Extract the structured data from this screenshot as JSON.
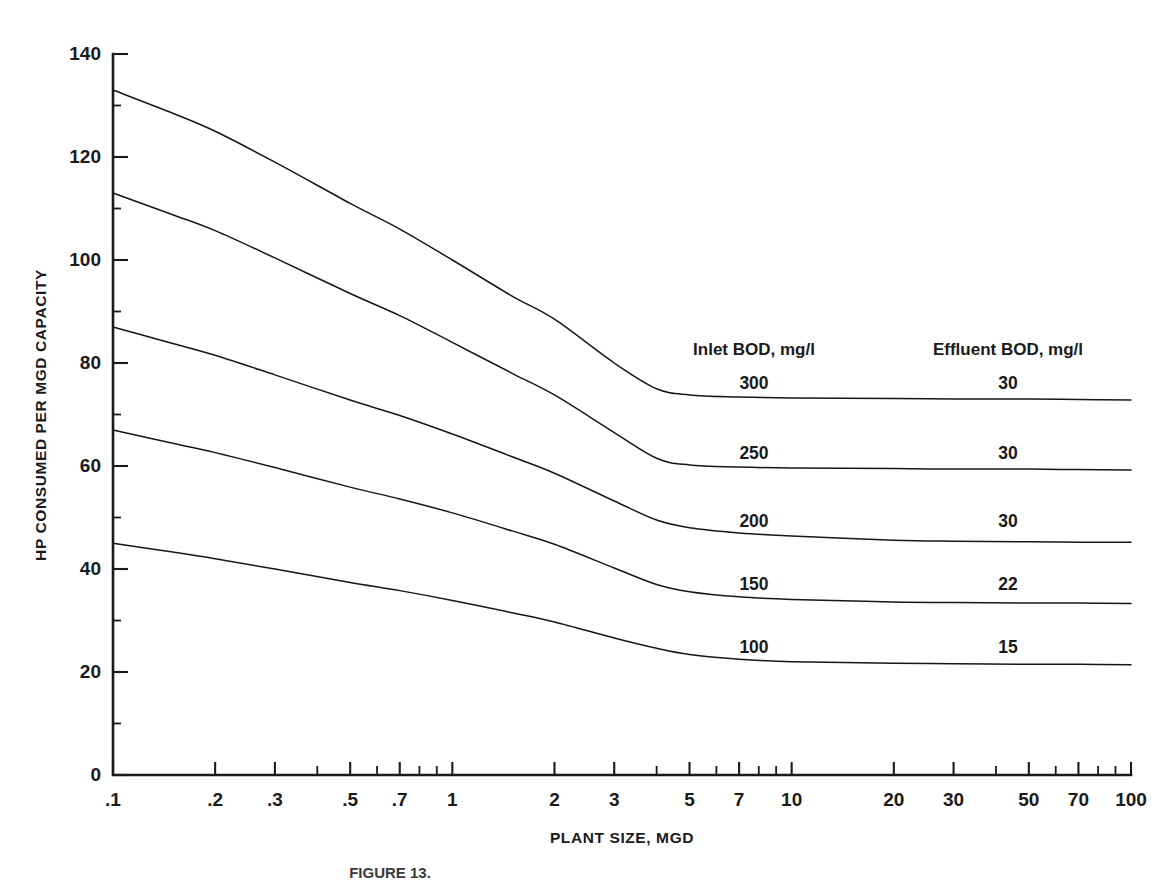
{
  "figure": {
    "caption": "FIGURE 13.",
    "background_color": "#ffffff",
    "line_color": "#161616"
  },
  "chart_data": {
    "type": "line",
    "title": "",
    "xlabel": "PLANT SIZE, MGD",
    "ylabel": "HP CONSUMED PER MGD CAPACITY",
    "xscale": "log",
    "xlim": [
      0.1,
      100
    ],
    "ylim": [
      0,
      140
    ],
    "grid": false,
    "legend_position": "inside-right",
    "xtick_labels": [
      ".1",
      ".2",
      ".3",
      ".5",
      ".7",
      "1",
      "2",
      "3",
      "5",
      "7",
      "10",
      "20",
      "30",
      "50",
      "70",
      "100"
    ],
    "xtick_values": [
      0.1,
      0.2,
      0.3,
      0.5,
      0.7,
      1,
      2,
      3,
      5,
      7,
      10,
      20,
      30,
      50,
      70,
      100
    ],
    "xtick_minor_values": [
      0.4,
      0.6,
      0.8,
      0.9,
      4,
      6,
      8,
      9,
      40,
      60,
      80,
      90
    ],
    "ytick_labels": [
      "0",
      "20",
      "40",
      "60",
      "80",
      "100",
      "120",
      "140"
    ],
    "ytick_values": [
      0,
      20,
      40,
      60,
      80,
      100,
      120,
      140
    ],
    "ytick_minor_values": [
      10,
      30,
      50,
      70,
      90,
      110,
      130
    ],
    "legend_headers": {
      "inlet": "Inlet BOD, mg/l",
      "effluent": "Effluent BOD, mg/l"
    },
    "x": [
      0.1,
      0.15,
      0.2,
      0.3,
      0.5,
      0.7,
      1,
      1.5,
      2,
      3,
      4,
      5,
      7,
      10,
      20,
      30,
      50,
      70,
      100
    ],
    "series": [
      {
        "name": "300",
        "inlet_bod": "300",
        "effluent_bod": "30",
        "values": [
          133,
          128.5,
          125,
          119,
          111,
          106,
          100,
          93,
          88.5,
          80,
          75,
          73.8,
          73.4,
          73.2,
          73.1,
          73.0,
          73.0,
          72.9,
          72.8
        ]
      },
      {
        "name": "250",
        "inlet_bod": "250",
        "effluent_bod": "30",
        "values": [
          113,
          108.8,
          105.7,
          100.4,
          93.5,
          89.2,
          84,
          78,
          73.8,
          66.5,
          61.5,
          60.2,
          59.8,
          59.6,
          59.5,
          59.4,
          59.4,
          59.3,
          59.2
        ]
      },
      {
        "name": "200",
        "inlet_bod": "200",
        "effluent_bod": "30",
        "values": [
          87,
          83.8,
          81.5,
          77.7,
          72.8,
          69.8,
          66.2,
          61.8,
          58.6,
          53.2,
          49.5,
          48.0,
          47.0,
          46.4,
          45.6,
          45.4,
          45.3,
          45.2,
          45.2
        ]
      },
      {
        "name": "150",
        "inlet_bod": "150",
        "effluent_bod": "22",
        "values": [
          67,
          64.4,
          62.6,
          59.7,
          55.9,
          53.6,
          50.9,
          47.4,
          44.8,
          40.2,
          37.0,
          35.6,
          34.6,
          34.1,
          33.6,
          33.5,
          33.4,
          33.4,
          33.3
        ]
      },
      {
        "name": "100",
        "inlet_bod": "100",
        "effluent_bod": "15",
        "values": [
          45,
          43.3,
          42.0,
          40.0,
          37.4,
          35.8,
          33.9,
          31.5,
          29.7,
          26.6,
          24.6,
          23.4,
          22.5,
          22.0,
          21.7,
          21.6,
          21.5,
          21.5,
          21.4
        ]
      }
    ]
  }
}
